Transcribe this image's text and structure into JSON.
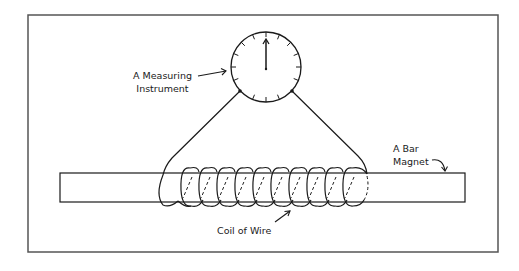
{
  "diagram": {
    "labels": {
      "meter_line1": "A Measuring",
      "meter_line2": "Instrument",
      "magnet_line1": "A Bar",
      "magnet_line2": "Magnet",
      "coil": "Coil of Wire"
    },
    "components": {
      "measuring_instrument": "dial meter with needle pointing straight up",
      "bar_magnet": "long horizontal rectangle",
      "coil": "coil of wire wound around the bar magnet, ends connected to meter"
    },
    "colors": {
      "stroke": "#1a1a1a",
      "frame": "#555555",
      "background": "#ffffff"
    }
  }
}
